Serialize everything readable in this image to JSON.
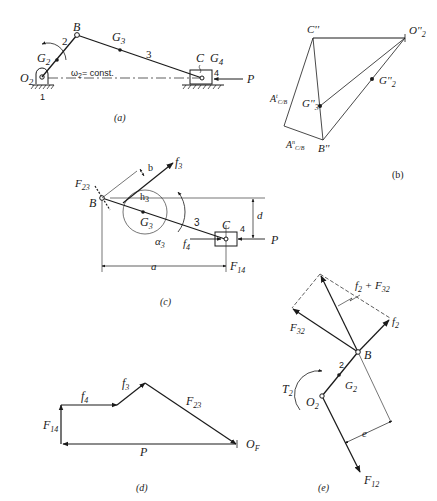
{
  "figure": {
    "panels": {
      "a": {
        "caption": "(a)",
        "labels": {
          "B": "B",
          "G2": "G",
          "G2_sub": "2",
          "G3": "G",
          "G3_sub": "3",
          "link2": "2",
          "link3": "3",
          "link4": "4",
          "C": "C",
          "G4": "G",
          "G4_sub": "4",
          "O2": "O",
          "O2_sub": "2",
          "ground": "1",
          "omega": "ω",
          "omega_sub": "2",
          "omega_text": "= const.",
          "P": "P"
        }
      },
      "b": {
        "caption": "(b)",
        "labels": {
          "C": "C''",
          "O2": "O''",
          "O2_sub": "2",
          "G2": "G''",
          "G2_sub": "2",
          "G3": "G''",
          "G3_sub": "3",
          "B": "B''",
          "At": "A",
          "At_sup": "t",
          "At_sub": "C/B",
          "An": "A",
          "An_sup": "n",
          "An_sub": "C/B"
        }
      },
      "c": {
        "caption": "(c)",
        "labels": {
          "F23": "F",
          "F23_sub": "23",
          "B": "B",
          "b": "b",
          "f3": "f",
          "f3_sub": "3",
          "h3": "h",
          "h3_sub": "3",
          "G3": "G",
          "G3_sub": "3",
          "alpha3": "α",
          "alpha3_sub": "3",
          "link3": "3",
          "C": "C",
          "link4": "4",
          "d": "d",
          "f4": "f",
          "f4_sub": "4",
          "P": "P",
          "a": "a",
          "F14": "F",
          "F14_sub": "14"
        }
      },
      "d": {
        "caption": "(d)",
        "labels": {
          "f4": "f",
          "f4_sub": "4",
          "f3": "f",
          "f3_sub": "3",
          "F23": "F",
          "F23_sub": "23",
          "F14": "F",
          "F14_sub": "14",
          "P": "P",
          "OF": "O",
          "OF_sub": "F"
        }
      },
      "e": {
        "caption": "(e)",
        "labels": {
          "sum": "f",
          "sum_sub": "2",
          "sum_plus": " + F",
          "sum_sub2": "32",
          "F32": "F",
          "F32_sub": "32",
          "f2": "f",
          "f2_sub": "2",
          "B": "B",
          "link2": "2",
          "G2": "G",
          "G2_sub": "2",
          "T2": "T",
          "T2_sub": "2",
          "O2": "O",
          "O2_sub": "2",
          "e": "e",
          "F12": "F",
          "F12_sub": "12"
        }
      }
    }
  }
}
